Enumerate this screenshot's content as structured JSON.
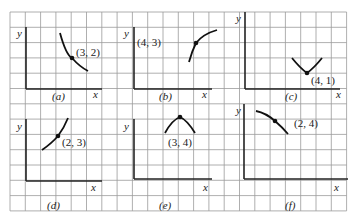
{
  "figure": {
    "grid": {
      "x0": 10,
      "y0": 12,
      "cell": 15.3,
      "cols": 22,
      "rows": 13,
      "color": "#9a9a9a"
    },
    "panels": [
      {
        "id": "a",
        "caption": "(a)",
        "point_label": "(3, 2)",
        "axis": {
          "ox": 26,
          "oy": 89,
          "ytop": 27,
          "xend": 102
        },
        "axis_labels": {
          "y": "y",
          "x": "x"
        },
        "label_pos": {
          "y": [
            17,
            37
          ],
          "x": [
            93,
            98
          ],
          "caption": [
            52,
            100
          ],
          "point": [
            76,
            56
          ]
        },
        "curve": "M60,33 Q66,55 72,58 Q80,67 88,71",
        "dot": [
          72,
          58
        ]
      },
      {
        "id": "b",
        "caption": "(b)",
        "point_label": "(4, 3)",
        "axis": {
          "ox": 134,
          "oy": 89,
          "ytop": 27,
          "xend": 212
        },
        "axis_labels": {
          "y": "y",
          "x": "x"
        },
        "label_pos": {
          "y": [
            124,
            37
          ],
          "x": [
            202,
            98
          ],
          "caption": [
            159,
            100
          ],
          "point": [
            137,
            46
          ]
        },
        "curve": "M189,62 Q192,51 196,43 Q203,34 217,30",
        "dot": [
          196,
          43
        ]
      },
      {
        "id": "c",
        "caption": "(c)",
        "point_label": "(4, 1)",
        "axis": {
          "ox": 245,
          "oy": 89,
          "ytop": 12,
          "xend": 340
        },
        "axis_labels": {
          "y": "y",
          "x": "x"
        },
        "label_pos": {
          "y": [
            236,
            22
          ],
          "x": [
            336,
            98
          ],
          "caption": [
            285,
            100
          ],
          "point": [
            311,
            84
          ]
        },
        "curve": "M292,58 Q300,68 307,73 Q314,68 322,58",
        "dot": [
          307,
          73
        ]
      },
      {
        "id": "d",
        "caption": "(d)",
        "point_label": "(2, 3)",
        "axis": {
          "ox": 26,
          "oy": 181,
          "ytop": 119,
          "xend": 102
        },
        "axis_labels": {
          "y": "y",
          "x": "x"
        },
        "label_pos": {
          "y": [
            17,
            130
          ],
          "x": [
            91,
            191
          ],
          "caption": [
            47,
            209
          ],
          "point": [
            62,
            146
          ]
        },
        "curve": "M42,150 Q52,143 58,136 Q64,128 68,118",
        "dot": [
          58,
          136
        ]
      },
      {
        "id": "e",
        "caption": "(e)",
        "point_label": "(3, 4)",
        "axis": {
          "ox": 134,
          "oy": 179,
          "ytop": 119,
          "xend": 212
        },
        "axis_labels": {
          "y": "y",
          "x": "x"
        },
        "label_pos": {
          "y": [
            124,
            130
          ],
          "x": [
            203,
            191
          ],
          "caption": [
            159,
            209
          ],
          "point": [
            168,
            146
          ]
        },
        "curve": "M165,133 Q172,120 180,117 Q187,120 195,133",
        "dot": [
          180,
          117
        ]
      },
      {
        "id": "f",
        "caption": "(f)",
        "point_label": "(2, 4)",
        "axis": {
          "ox": 244,
          "oy": 179,
          "ytop": 104,
          "xend": 348
        },
        "axis_labels": {
          "y": "y",
          "x": "x"
        },
        "label_pos": {
          "y": [
            236,
            114
          ],
          "x": [
            334,
            191
          ],
          "caption": [
            285,
            209
          ],
          "point": [
            294,
            127
          ]
        },
        "curve": "M256,111 Q266,113 275,121 Q282,127 288,134",
        "dot": [
          275,
          121
        ]
      }
    ]
  }
}
